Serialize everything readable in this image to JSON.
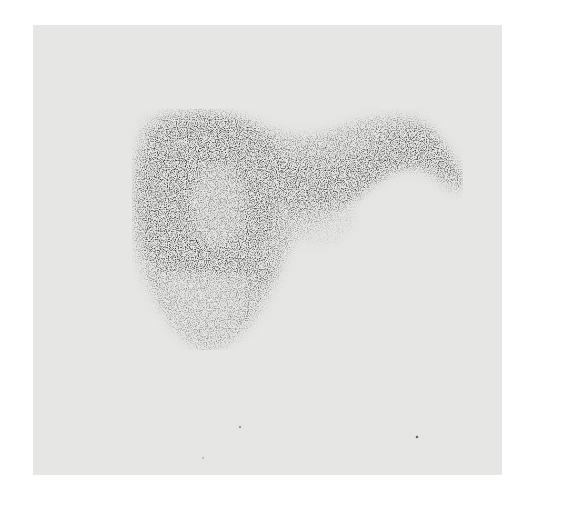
{
  "image": {
    "type": "grayscale scintigraphy scan",
    "subject": "liver-shaped radionuclide uptake",
    "background_color": "#ffffff",
    "panel_color": "#e6e6e4",
    "uptake_color": "#1a1a1a",
    "alt_text": "Grayscale nuclear scan image showing a liver-shaped region of tracer uptake with a dark right lobe, a lighter mottled lower portion, and a tapering left lobe extending to the upper right"
  }
}
